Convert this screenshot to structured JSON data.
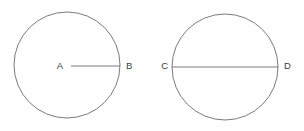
{
  "figure": {
    "background_color": "#ffffff",
    "stroke_color": "#6b6b6b",
    "label_color": "#3a3a3a",
    "stroke_width": 0.9
  },
  "shapes": [
    {
      "name": "circle-radius",
      "type": "circle",
      "cx": 67,
      "cy": 65,
      "r": 53,
      "segment": {
        "name": "radius-segment",
        "type": "radius",
        "x1": 71,
        "y1": 66,
        "x2": 120,
        "y2": 66
      },
      "labels": [
        {
          "text": "A",
          "x": 67,
          "y": 66,
          "anchor": "end",
          "dx": -4
        },
        {
          "text": "B",
          "x": 121,
          "y": 66,
          "anchor": "start",
          "dx": 5
        }
      ]
    },
    {
      "name": "circle-diameter",
      "type": "circle",
      "cx": 225,
      "cy": 67,
      "r": 53,
      "segment": {
        "name": "diameter-segment",
        "type": "diameter",
        "x1": 172,
        "y1": 67,
        "x2": 278,
        "y2": 67
      },
      "labels": [
        {
          "text": "C",
          "x": 171,
          "y": 66,
          "anchor": "end",
          "dx": -4
        },
        {
          "text": "D",
          "x": 279,
          "y": 66,
          "anchor": "start",
          "dx": 5
        }
      ]
    }
  ],
  "labels": {
    "a": "A",
    "b": "B",
    "c": "C",
    "d": "D"
  }
}
